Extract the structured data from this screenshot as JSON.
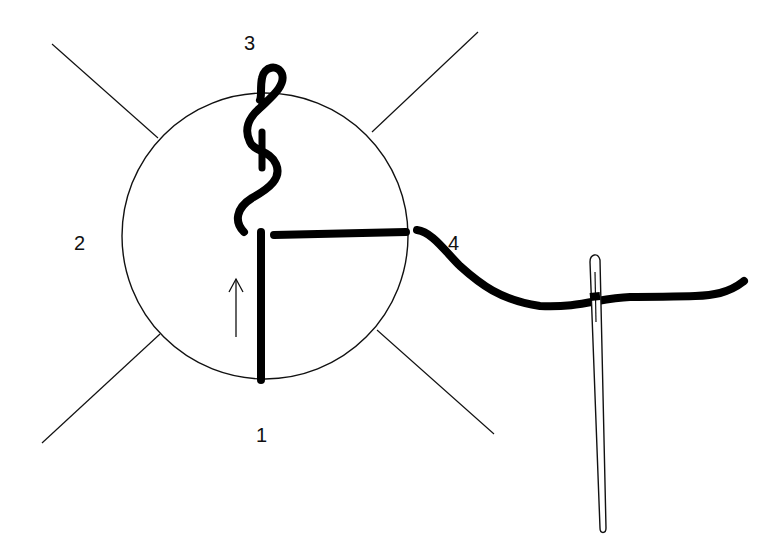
{
  "diagram": {
    "type": "stitch-instruction",
    "labels": {
      "point_1": "1",
      "point_2": "2",
      "point_3": "3",
      "point_4": "4"
    },
    "colors": {
      "ink": "#000000",
      "background": "#ffffff"
    },
    "elements": [
      "circle-outline",
      "diagonal-guide-lines",
      "vertical-thread",
      "twisted-loop-thread",
      "horizontal-thread",
      "trailing-thread",
      "needle",
      "direction-arrow"
    ]
  }
}
